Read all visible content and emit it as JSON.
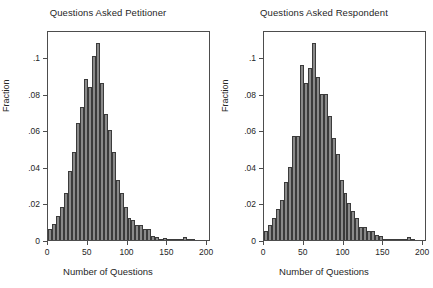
{
  "figure": {
    "background": "#ffffff",
    "bar_fill": "#8a8a8a",
    "bar_edge": "#3b3b3b",
    "axis_color": "#4d4d4d"
  },
  "chart_data": [
    {
      "type": "bar",
      "title": "Questions Asked Petitioner",
      "xlabel": "Number of Questions",
      "ylabel": "Fraction",
      "xlim": [
        0,
        205
      ],
      "ylim": [
        0,
        0.115
      ],
      "xticks": [
        0,
        50,
        100,
        150,
        200
      ],
      "xtick_labels": [
        "0",
        "50",
        "100",
        "150",
        "200"
      ],
      "yticks": [
        0,
        0.02,
        0.04,
        0.06,
        0.08,
        0.1
      ],
      "ytick_labels": [
        "0",
        ".02",
        ".04",
        ".06",
        ".08",
        ".1"
      ],
      "grid": false,
      "legend": "none",
      "bin_width": 5,
      "bin_centers": [
        2.5,
        7.5,
        12.5,
        17.5,
        22.5,
        27.5,
        32.5,
        37.5,
        42.5,
        47.5,
        52.5,
        57.5,
        62.5,
        67.5,
        72.5,
        77.5,
        82.5,
        87.5,
        92.5,
        97.5,
        102.5,
        107.5,
        112.5,
        117.5,
        122.5,
        127.5,
        132.5,
        137.5,
        142.5,
        147.5,
        152.5,
        157.5,
        162.5,
        167.5,
        172.5,
        177.5,
        182.5,
        187.5,
        192.5,
        197.5
      ],
      "values": [
        0.006,
        0.009,
        0.013,
        0.018,
        0.026,
        0.038,
        0.048,
        0.064,
        0.073,
        0.088,
        0.084,
        0.101,
        0.108,
        0.086,
        0.069,
        0.06,
        0.048,
        0.033,
        0.026,
        0.018,
        0.012,
        0.011,
        0.008,
        0.008,
        0.006,
        0.006,
        0.002,
        0.0015,
        0.0007,
        0.001,
        0.0005,
        0.0003,
        0.0003,
        0.0005,
        0.0015,
        0.0002,
        0.0002,
        0.0,
        0.0,
        0.0
      ]
    },
    {
      "type": "bar",
      "title": "Questions Asked Respondent",
      "xlabel": "Number of Questions",
      "ylabel": "Fraction",
      "xlim": [
        0,
        205
      ],
      "ylim": [
        0,
        0.115
      ],
      "xticks": [
        0,
        50,
        100,
        150,
        200
      ],
      "xtick_labels": [
        "0",
        "50",
        "100",
        "150",
        "200"
      ],
      "yticks": [
        0,
        0.02,
        0.04,
        0.06,
        0.08,
        0.1
      ],
      "ytick_labels": [
        "0",
        ".02",
        ".04",
        ".06",
        ".08",
        ".1"
      ],
      "grid": false,
      "legend": "none",
      "bin_width": 5,
      "bin_centers": [
        2.5,
        7.5,
        12.5,
        17.5,
        22.5,
        27.5,
        32.5,
        37.5,
        42.5,
        47.5,
        52.5,
        57.5,
        62.5,
        67.5,
        72.5,
        77.5,
        82.5,
        87.5,
        92.5,
        97.5,
        102.5,
        107.5,
        112.5,
        117.5,
        122.5,
        127.5,
        132.5,
        137.5,
        142.5,
        147.5,
        152.5,
        157.5,
        162.5,
        167.5,
        172.5,
        177.5,
        182.5,
        187.5,
        192.5,
        197.5
      ],
      "values": [
        0.005,
        0.008,
        0.012,
        0.017,
        0.022,
        0.032,
        0.04,
        0.057,
        0.057,
        0.096,
        0.086,
        0.094,
        0.108,
        0.089,
        0.08,
        0.08,
        0.068,
        0.056,
        0.047,
        0.033,
        0.026,
        0.02,
        0.016,
        0.012,
        0.007,
        0.007,
        0.005,
        0.005,
        0.003,
        0.002,
        0.0008,
        0.0004,
        0.0003,
        0.0002,
        0.0002,
        0.0003,
        0.0015,
        0.0002,
        0.0,
        0.0
      ]
    }
  ]
}
